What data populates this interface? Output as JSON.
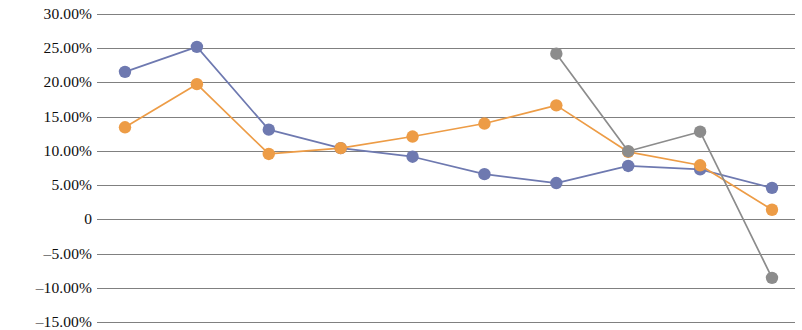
{
  "chart_data": {
    "type": "line",
    "title": "",
    "subtitle": "",
    "xlabel": "",
    "ylabel": "",
    "grid": true,
    "legend_position": "none",
    "ylim": [
      -0.15,
      0.3
    ],
    "y_tick_values": [
      0.3,
      0.25,
      0.2,
      0.15,
      0.1,
      0.05,
      0,
      -0.05,
      -0.1,
      -0.15
    ],
    "y_tick_labels": [
      "30.00%",
      "25.00%",
      "20.00%",
      "15.00%",
      "10.00%",
      "5.00%",
      "0",
      "–5.00%",
      "–10.00%",
      "–15.00%"
    ],
    "x": [
      1,
      2,
      3,
      4,
      5,
      6,
      7,
      8,
      9,
      10
    ],
    "x_tick_labels": [],
    "series": [
      {
        "name": "series-1",
        "color": "#6e79b0",
        "marker": "circle",
        "values": [
          0.2155,
          0.252,
          0.131,
          0.104,
          0.0915,
          0.066,
          0.053,
          0.078,
          0.073,
          0.046
        ]
      },
      {
        "name": "series-2",
        "color": "#ed9c46",
        "marker": "circle",
        "values": [
          0.1345,
          0.1975,
          0.0955,
          0.104,
          0.121,
          0.14,
          0.1665,
          0.0985,
          0.079,
          0.014
        ]
      },
      {
        "name": "series-3",
        "color": "#8c8c8c",
        "marker": "circle",
        "values": [
          null,
          null,
          null,
          null,
          null,
          null,
          0.242,
          0.0995,
          0.128,
          -0.0855
        ]
      }
    ]
  },
  "axes": {
    "plot_left_px": 97,
    "plot_right_px": 795,
    "first_point_x_px": 125,
    "last_point_x_px": 772,
    "y_top_value": 0.3,
    "y_top_px": 14,
    "y_bottom_value": -0.15,
    "y_bottom_px": 322
  }
}
